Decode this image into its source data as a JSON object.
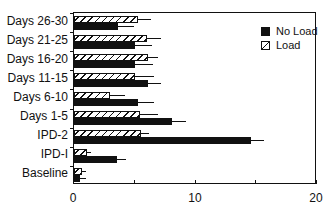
{
  "chart_data": {
    "type": "bar",
    "orientation": "horizontal",
    "title": "",
    "xlabel": "",
    "ylabel": "",
    "xlim": [
      0,
      20
    ],
    "xticks": [
      0,
      10,
      20
    ],
    "grid": false,
    "legend_position": "top-right",
    "categories": [
      "Days 26-30",
      "Days 21-25",
      "Days 16-20",
      "Days 11-15",
      "Days 6-10",
      "Days 1-5",
      "IPD-2",
      "IPD-I",
      "Baseline"
    ],
    "series": [
      {
        "name": "No Load",
        "fill": "solid",
        "color": "#111111",
        "values": [
          3.6,
          5.0,
          5.0,
          6.1,
          5.3,
          8.1,
          14.6,
          3.5,
          0.5
        ],
        "error": [
          1.3,
          1.4,
          1.5,
          1.1,
          1.3,
          1.1,
          1.0,
          0.8,
          0.5
        ]
      },
      {
        "name": "Load",
        "fill": "hatched",
        "color": "#ffffff",
        "values": [
          5.3,
          6.0,
          6.1,
          5.0,
          3.0,
          5.4,
          5.5,
          1.1,
          0.65
        ],
        "error": [
          1.0,
          1.2,
          0.8,
          1.6,
          1.2,
          1.5,
          0.7,
          0.3,
          0.35
        ]
      }
    ]
  },
  "legend": {
    "noload": "No Load",
    "load": "Load"
  },
  "xaxis": {
    "t0": "0",
    "t10": "10",
    "t20": "20"
  }
}
